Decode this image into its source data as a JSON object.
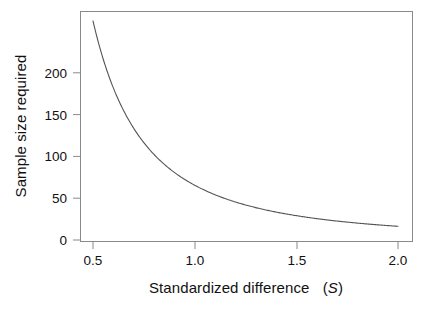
{
  "chart_data": {
    "type": "line",
    "title": "",
    "subtitle": "",
    "xlabel": "Standardized difference  (S)",
    "xlabel_plain": "Standardized difference",
    "xlabel_variable": "S",
    "ylabel": "Sample size required",
    "xlim": [
      0.45,
      2.05
    ],
    "ylim": [
      0,
      265
    ],
    "xticks": [
      0.5,
      1.0,
      1.5,
      2.0
    ],
    "xtick_labels": [
      "0.5",
      "1.0",
      "1.5",
      "2.0"
    ],
    "yticks": [
      0,
      50,
      100,
      150,
      200
    ],
    "ytick_labels": [
      "0",
      "50",
      "100",
      "150",
      "200"
    ],
    "grid": false,
    "legend": "none",
    "line_color": "#555555",
    "frame_color": "#888888",
    "relationship": "n = 70 / S^2",
    "x": [
      0.5,
      0.55,
      0.6,
      0.65,
      0.7,
      0.75,
      0.8,
      0.85,
      0.9,
      0.95,
      1.0,
      1.05,
      1.1,
      1.15,
      1.2,
      1.25,
      1.3,
      1.35,
      1.4,
      1.45,
      1.5,
      1.55,
      1.6,
      1.65,
      1.7,
      1.75,
      1.8,
      1.85,
      1.9,
      1.95,
      2.0
    ],
    "values": [
      262,
      217,
      182,
      155,
      134,
      117,
      103,
      91,
      81,
      73,
      74,
      67,
      61,
      56,
      51,
      47,
      44,
      41,
      38,
      35,
      35,
      33,
      31,
      29,
      27,
      26,
      24,
      23,
      22,
      21,
      18
    ],
    "series": [
      {
        "name": "Sample size required",
        "x": [
          0.5,
          0.55,
          0.6,
          0.65,
          0.7,
          0.75,
          0.8,
          0.85,
          0.9,
          0.95,
          1.0,
          1.05,
          1.1,
          1.15,
          1.2,
          1.25,
          1.3,
          1.35,
          1.4,
          1.45,
          1.5,
          1.55,
          1.6,
          1.65,
          1.7,
          1.75,
          1.8,
          1.85,
          1.9,
          1.95,
          2.0
        ],
        "values": [
          262.0,
          216.5,
          181.9,
          155.1,
          133.9,
          116.8,
          102.8,
          91.1,
          81.3,
          72.9,
          70.0,
          63.5,
          57.9,
          52.9,
          48.6,
          44.8,
          41.4,
          38.4,
          35.7,
          33.3,
          31.1,
          29.1,
          27.3,
          25.7,
          24.2,
          22.9,
          21.6,
          20.5,
          19.4,
          18.4,
          17.5
        ]
      }
    ]
  }
}
